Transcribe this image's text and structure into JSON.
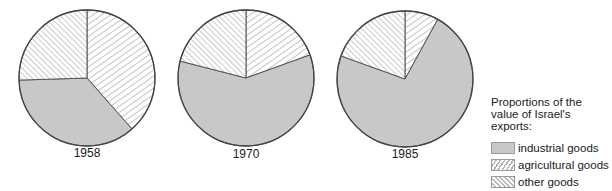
{
  "chart_data": {
    "type": "pie",
    "title": "Proportions of the value of Israel's exports:",
    "series_names": [
      "industrial goods",
      "agricultural goods",
      "other goods"
    ],
    "pies": [
      {
        "label": "1958",
        "values": {
          "industrial goods": 36,
          "agricultural goods": 38.5,
          "other goods": 25.5
        }
      },
      {
        "label": "1970",
        "values": {
          "industrial goods": 59.5,
          "agricultural goods": 19.5,
          "other goods": 21
        }
      },
      {
        "label": "1985",
        "values": {
          "industrial goods": 72.5,
          "agricultural goods": 8,
          "other goods": 19.5
        }
      }
    ],
    "legend_position": "right-bottom",
    "units": "percent (estimated from slice angles)"
  },
  "colors": {
    "industrial": "#c8c8c8",
    "hatch_line": "#b5b5b5",
    "outline": "#444444"
  },
  "labels": {
    "year_1958": "1958",
    "year_1970": "1970",
    "year_1985": "1985"
  },
  "legend": {
    "title": "Proportions of the value of Israel's exports:",
    "items": [
      {
        "label": "industrial goods",
        "pattern": "solid-gray"
      },
      {
        "label": "agricultural goods",
        "pattern": "hatch-forward-slash"
      },
      {
        "label": "other goods",
        "pattern": "hatch-back-slash"
      }
    ]
  }
}
